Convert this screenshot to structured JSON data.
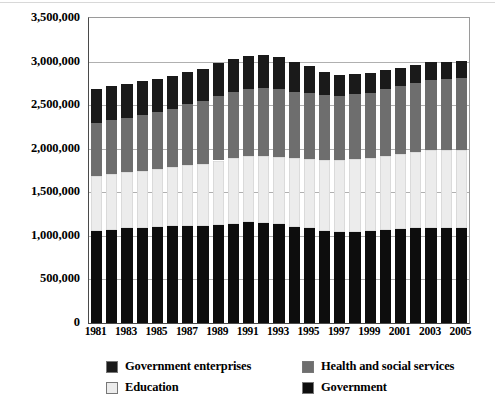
{
  "chart_data": {
    "type": "bar",
    "stacked": true,
    "title": "",
    "subtitle": "",
    "xlabel": "",
    "ylabel": "",
    "ylim": [
      0,
      3500000
    ],
    "ytick_labels": [
      "0",
      "500,000",
      "1,000,000",
      "1,500,000",
      "2,000,000",
      "2,500,000",
      "3,000,000",
      "3,500,000"
    ],
    "ytick_values": [
      0,
      500000,
      1000000,
      1500000,
      2000000,
      2500000,
      3000000,
      3500000
    ],
    "grid": true,
    "legend_position": "bottom",
    "categories": [
      1981,
      1982,
      1983,
      1984,
      1985,
      1986,
      1987,
      1988,
      1989,
      1990,
      1991,
      1992,
      1993,
      1994,
      1995,
      1996,
      1997,
      1998,
      1999,
      2000,
      2001,
      2002,
      2003,
      2004,
      2005
    ],
    "xtick_labels": [
      "1981",
      "1983",
      "1985",
      "1987",
      "1989",
      "1991",
      "1993",
      "1995",
      "1997",
      "1999",
      "2001",
      "2003",
      "2005"
    ],
    "xtick_categories": [
      1981,
      1983,
      1985,
      1987,
      1989,
      1991,
      1993,
      1995,
      1997,
      1999,
      2001,
      2003,
      2005
    ],
    "series": [
      {
        "name": "Government",
        "color": "#0d0d0d",
        "values": [
          1056000,
          1070000,
          1085000,
          1095000,
          1100000,
          1110000,
          1115000,
          1110000,
          1120000,
          1140000,
          1155000,
          1150000,
          1135000,
          1100000,
          1085000,
          1060000,
          1045000,
          1050000,
          1055000,
          1070000,
          1080000,
          1090000,
          1095000,
          1090000,
          1095000
        ]
      },
      {
        "name": "Education",
        "color": "#ececec",
        "values": [
          632000,
          640000,
          645000,
          650000,
          665000,
          680000,
          700000,
          720000,
          745000,
          755000,
          760000,
          770000,
          775000,
          790000,
          800000,
          815000,
          825000,
          835000,
          840000,
          850000,
          860000,
          875000,
          885000,
          890000,
          895000
        ]
      },
      {
        "name": "Health and social services",
        "color": "#6e6e6e",
        "values": [
          608000,
          620000,
          625000,
          640000,
          655000,
          670000,
          695000,
          720000,
          740000,
          760000,
          775000,
          775000,
          770000,
          760000,
          750000,
          745000,
          740000,
          740000,
          745000,
          760000,
          775000,
          790000,
          805000,
          815000,
          825000
        ]
      },
      {
        "name": "Government enterprises",
        "color": "#1a1a1a",
        "values": [
          390000,
          390000,
          385000,
          390000,
          385000,
          380000,
          375000,
          370000,
          375000,
          375000,
          375000,
          375000,
          370000,
          350000,
          310000,
          260000,
          240000,
          235000,
          230000,
          225000,
          215000,
          210000,
          205000,
          200000,
          190000
        ]
      }
    ],
    "totals": [
      2686000,
      2720000,
      2740000,
      2775000,
      2805000,
      2840000,
      2885000,
      2920000,
      2980000,
      3030000,
      3065000,
      3070000,
      3050000,
      3000000,
      2945000,
      2880000,
      2850000,
      2860000,
      2870000,
      2905000,
      2930000,
      2965000,
      2990000,
      2995000,
      3005000
    ]
  },
  "legend": {
    "items": [
      {
        "label": "Government enterprises",
        "color": "#1a1a1a"
      },
      {
        "label": "Health and social services",
        "color": "#6e6e6e"
      },
      {
        "label": "Education",
        "color": "#ececec"
      },
      {
        "label": "Government",
        "color": "#0d0d0d"
      }
    ]
  }
}
